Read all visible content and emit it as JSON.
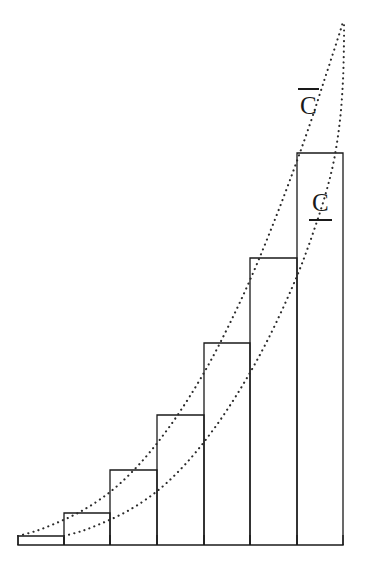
{
  "figure": {
    "background_color": "#ffffff",
    "stroke_color": "#1a1a1a",
    "dot_color": "#2b2b2b",
    "width": 365,
    "height": 565
  },
  "labels": {
    "upper_sum": {
      "text": "C",
      "accent": "overbar",
      "rendered": "C̄",
      "meaning": "upper Darboux sum curve",
      "x": 299,
      "y": 93
    },
    "lower_sum": {
      "text": "C",
      "accent": "underbar",
      "rendered": "C̲",
      "meaning": "lower Darboux sum curve",
      "x": 311,
      "y": 190
    }
  },
  "chart_data": {
    "type": "bar",
    "title": "",
    "xlabel": "",
    "ylabel": "",
    "grid": false,
    "legend_position": "inline-annotation",
    "axis": {
      "baseline_y": 545,
      "x_min": 18,
      "x_max": 343,
      "xlim": [
        18,
        343
      ],
      "ylim": [
        545,
        22
      ]
    },
    "partition_x": [
      18,
      64,
      110,
      157,
      204,
      250,
      297,
      343
    ],
    "categories": [
      "1",
      "2",
      "3",
      "4",
      "5",
      "6",
      "7"
    ],
    "bar_tops_y": [
      536,
      513,
      470,
      415,
      343,
      258,
      153
    ],
    "values": [
      9,
      32,
      75,
      130,
      202,
      287,
      392
    ],
    "bars": [
      {
        "index": 1,
        "x0": 18,
        "x1": 64,
        "top_y": 536,
        "height": 9
      },
      {
        "index": 2,
        "x0": 64,
        "x1": 110,
        "top_y": 513,
        "height": 32
      },
      {
        "index": 3,
        "x0": 110,
        "x1": 157,
        "top_y": 470,
        "height": 75
      },
      {
        "index": 4,
        "x0": 157,
        "x1": 204,
        "top_y": 415,
        "height": 130
      },
      {
        "index": 5,
        "x0": 204,
        "x1": 250,
        "top_y": 343,
        "height": 202
      },
      {
        "index": 6,
        "x0": 250,
        "x1": 297,
        "top_y": 258,
        "height": 287
      },
      {
        "index": 7,
        "x0": 297,
        "x1": 343,
        "top_y": 153,
        "height": 392
      }
    ],
    "curves": [
      {
        "name": "upper_sum_curve",
        "label": "C̄",
        "style": "dotted",
        "description": "convex increasing curve through the top-left corners of each bar",
        "points": [
          [
            18,
            536
          ],
          [
            36,
            531
          ],
          [
            54,
            524
          ],
          [
            72,
            516
          ],
          [
            90,
            506
          ],
          [
            110,
            492
          ],
          [
            130,
            474
          ],
          [
            150,
            452
          ],
          [
            170,
            426
          ],
          [
            190,
            396
          ],
          [
            210,
            362
          ],
          [
            230,
            323
          ],
          [
            250,
            280
          ],
          [
            270,
            232
          ],
          [
            290,
            180
          ],
          [
            310,
            124
          ],
          [
            325,
            78
          ],
          [
            338,
            38
          ],
          [
            343,
            22
          ]
        ]
      },
      {
        "name": "lower_sum_curve",
        "label": "C̲",
        "style": "dotted",
        "description": "convex increasing curve through the top-right corners of each bar",
        "points": [
          [
            64,
            536
          ],
          [
            82,
            531
          ],
          [
            100,
            524
          ],
          [
            118,
            516
          ],
          [
            136,
            506
          ],
          [
            156,
            492
          ],
          [
            176,
            474
          ],
          [
            196,
            452
          ],
          [
            216,
            426
          ],
          [
            236,
            396
          ],
          [
            256,
            362
          ],
          [
            276,
            323
          ],
          [
            297,
            276
          ],
          [
            312,
            236
          ],
          [
            325,
            196
          ],
          [
            334,
            160
          ],
          [
            340,
            120
          ],
          [
            343,
            80
          ],
          [
            344,
            40
          ],
          [
            344,
            22
          ]
        ]
      }
    ]
  }
}
